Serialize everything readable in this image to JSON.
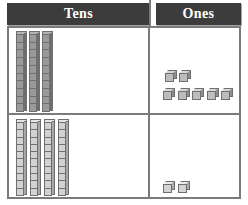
{
  "chart_data": {
    "type": "table",
    "columns": [
      "Tens",
      "Ones"
    ],
    "rows": [
      {
        "tens": 3,
        "ones": 7,
        "value": 37
      },
      {
        "tens": 4,
        "ones": 2,
        "value": 42
      }
    ],
    "block_type": "base-ten-blocks",
    "tens_block_units": 10,
    "grid": true,
    "legend": "none"
  },
  "header": {
    "tens_label": "Tens",
    "ones_label": "Ones"
  },
  "colors": {
    "header_background": "#3c3c3c",
    "header_text": "#ffffff",
    "border": "#7b7b7b",
    "cell_background": "#ffffff",
    "rod_dark": "#9a9a9a",
    "rod_light": "#d2d2d2",
    "cube_face": "#bdbdbd"
  },
  "rows": [
    {
      "row_index": 1,
      "tens": {
        "count": 3,
        "shade": "dark",
        "rods": [
          {
            "x": 7,
            "y": 3,
            "height": 78,
            "segments": 10
          },
          {
            "x": 20,
            "y": 3,
            "height": 78,
            "segments": 10
          },
          {
            "x": 33,
            "y": 3,
            "height": 78,
            "segments": 10
          }
        ]
      },
      "ones": {
        "count": 7,
        "shade": "dark",
        "cubes": [
          {
            "x": 14,
            "y": 42
          },
          {
            "x": 28,
            "y": 42
          },
          {
            "x": 12,
            "y": 60
          },
          {
            "x": 27,
            "y": 60
          },
          {
            "x": 41,
            "y": 60
          },
          {
            "x": 56,
            "y": 60
          },
          {
            "x": 70,
            "y": 60
          }
        ]
      }
    },
    {
      "row_index": 2,
      "tens": {
        "count": 4,
        "shade": "light",
        "rods": [
          {
            "x": 7,
            "y": 4,
            "height": 74,
            "segments": 10
          },
          {
            "x": 21,
            "y": 4,
            "height": 74,
            "segments": 10
          },
          {
            "x": 35,
            "y": 4,
            "height": 74,
            "segments": 10
          },
          {
            "x": 49,
            "y": 4,
            "height": 74,
            "segments": 10
          }
        ]
      },
      "ones": {
        "count": 2,
        "shade": "light",
        "cubes": [
          {
            "x": 12,
            "y": 66
          },
          {
            "x": 27,
            "y": 66
          }
        ]
      }
    }
  ]
}
